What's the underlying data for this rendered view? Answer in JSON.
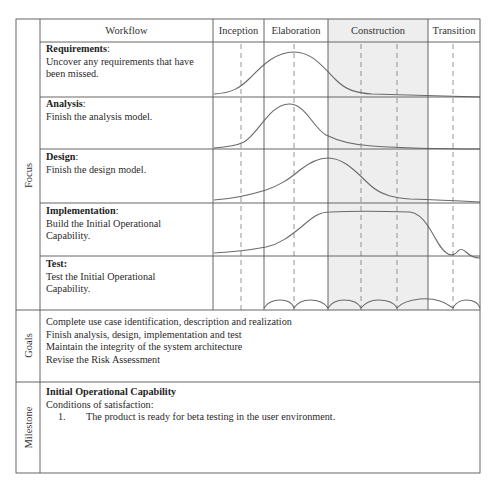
{
  "header": {
    "workflow_label": "Workflow",
    "phases": [
      {
        "name": "Inception",
        "x0": 213,
        "x1": 264,
        "shaded": false,
        "dashes": [
          241
        ]
      },
      {
        "name": "Elaboration",
        "x0": 264,
        "x1": 328,
        "shaded": false,
        "dashes": [
          294
        ]
      },
      {
        "name": "Construction",
        "x0": 328,
        "x1": 428,
        "shaded": true,
        "dashes": [
          361,
          397
        ]
      },
      {
        "name": "Transition",
        "x0": 428,
        "x1": 480,
        "shaded": false,
        "dashes": [
          453
        ]
      }
    ]
  },
  "sections": {
    "focus_label": "Focus",
    "goals_label": "Goals",
    "milestone_label": "Milestone"
  },
  "workflows": [
    {
      "title": "Requirements",
      "title_suffix": ":",
      "description": "Uncover any requirements that have been missed."
    },
    {
      "title": "Analysis",
      "title_suffix": ":",
      "description": "Finish the analysis model."
    },
    {
      "title": "Design",
      "title_suffix": ":",
      "description": "Finish the design model."
    },
    {
      "title": "Implementation",
      "title_suffix": ":",
      "description": "Build the Initial Operational Capability."
    },
    {
      "title": "Test:",
      "title_suffix": "",
      "description": "Test the Initial Operational Capability."
    }
  ],
  "goals": [
    "Complete use case identification, description and realization",
    "Finish analysis, design, implementation and test",
    "Maintain the integrity of the system architecture",
    "Revise the Risk Assessment"
  ],
  "milestone": {
    "title": "Initial Operational Capability",
    "subtitle": "Conditions of satisfaction:",
    "conditions": [
      {
        "number": "1.",
        "text": "The product is ready for beta testing in the user environment."
      }
    ]
  },
  "colors": {
    "border": "#555555",
    "shade": "#eeeeee",
    "curve": "#6a6a6a",
    "dash": "#777777"
  }
}
